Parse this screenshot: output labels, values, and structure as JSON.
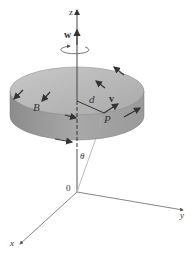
{
  "diagram": {
    "labels": {
      "z_axis": "z",
      "x_axis": "x",
      "y_axis": "y",
      "origin": "0",
      "angular_velocity": "w",
      "point_B": "B",
      "distance": "d",
      "velocity": "v",
      "point_P": "P",
      "angle": "θ"
    },
    "colors": {
      "disk_top": "#b9b9b9",
      "disk_side": "#9a9a9a",
      "axis": "#555555",
      "arrow": "#333333",
      "background": "#ffffff"
    }
  }
}
